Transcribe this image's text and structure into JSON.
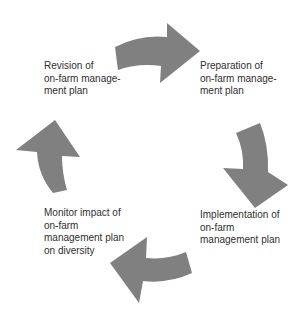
{
  "diagram": {
    "type": "cycle",
    "arrow_color": "#808080",
    "text_color": "#2f2f2f",
    "stages": [
      {
        "id": "preparation",
        "lines": [
          "Preparation of",
          "on-farm manage-",
          "ment plan"
        ]
      },
      {
        "id": "implementation",
        "lines": [
          "Implementation of",
          "on-farm",
          "management plan"
        ]
      },
      {
        "id": "monitor",
        "lines": [
          "Monitor impact of",
          "on-farm",
          "management plan",
          "on diversity"
        ]
      },
      {
        "id": "revision",
        "lines": [
          "Revision of",
          "on-farm manage-",
          "ment plan"
        ]
      }
    ],
    "arrows": [
      {
        "from": "revision",
        "to": "preparation",
        "direction": "right"
      },
      {
        "from": "preparation",
        "to": "implementation",
        "direction": "down"
      },
      {
        "from": "implementation",
        "to": "monitor",
        "direction": "left"
      },
      {
        "from": "monitor",
        "to": "revision",
        "direction": "up"
      }
    ]
  }
}
